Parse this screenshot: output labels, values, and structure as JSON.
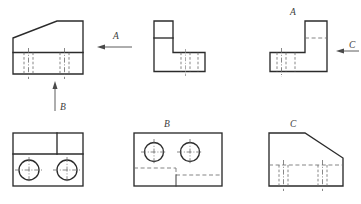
{
  "drawing": {
    "title": "Orthographic Projection - Machined Block",
    "sheet": {
      "width": 361,
      "height": 204,
      "background": "#ffffff"
    },
    "line_colors": {
      "object_line": "#2b2b2b",
      "hidden_line": "#6f6f6f",
      "center_line": "#6a6a6a",
      "arrow": "#4a4a4a",
      "label_text": "#3c3c3c"
    },
    "labels": {
      "arrow_a_top": "A",
      "arrow_b_bottom": "B",
      "arrow_c_right": "C",
      "view_a_label": "A",
      "view_b_label": "B",
      "view_c_label": "C"
    },
    "views": [
      {
        "id": "front-view",
        "name": "Front View",
        "position": "top-left",
        "description": "Trapezoidal profile with sloped upper-left edge and lower band containing hidden slot details",
        "features": [
          "sloped-top-edge",
          "horizontal-division-line",
          "hidden-vertical-edges",
          "center-lines"
        ]
      },
      {
        "id": "side-view-l",
        "name": "Side View",
        "position": "top-middle",
        "description": "L-shaped profile with upper arm divided by a horizontal line and lower arm with hidden vertical edges",
        "features": [
          "l-profile",
          "horizontal-division-line",
          "hidden-vertical-edges"
        ]
      },
      {
        "id": "view-a",
        "name": "View A",
        "position": "top-right",
        "description": "Mirrored L-shaped profile labeled A, viewed in direction of arrow C",
        "features": [
          "mirrored-l-profile",
          "hidden-horizontal-line",
          "hidden-vertical-edges",
          "center-lines"
        ]
      },
      {
        "id": "plan-view",
        "name": "Plan View",
        "position": "bottom-left",
        "description": "Rectangular plan with upper band split by a vertical line and two through holes below",
        "features": [
          "rectangle",
          "upper-band-divider",
          "two-circles",
          "crosshair-center-marks"
        ]
      },
      {
        "id": "view-b",
        "name": "View B",
        "position": "bottom-middle",
        "description": "Rectangular view with two through holes in upper region and hidden step outline below",
        "features": [
          "rectangle",
          "two-circles",
          "crosshair-center-marks",
          "hidden-step-outline"
        ]
      },
      {
        "id": "view-c",
        "name": "View C",
        "position": "bottom-right",
        "description": "Profile with sloped upper-right edge and lower band of hidden slot details",
        "features": [
          "sloped-top-edge",
          "hidden-horizontal-line",
          "hidden-vertical-edges",
          "center-lines"
        ]
      }
    ],
    "projection_arrows": [
      {
        "id": "arrow-a",
        "label": "A",
        "direction": "left",
        "points_to": "front-view"
      },
      {
        "id": "arrow-b",
        "label": "B",
        "direction": "up",
        "points_to": "front-view"
      },
      {
        "id": "arrow-c",
        "label": "C",
        "direction": "left",
        "points_to": "view-a"
      }
    ]
  }
}
